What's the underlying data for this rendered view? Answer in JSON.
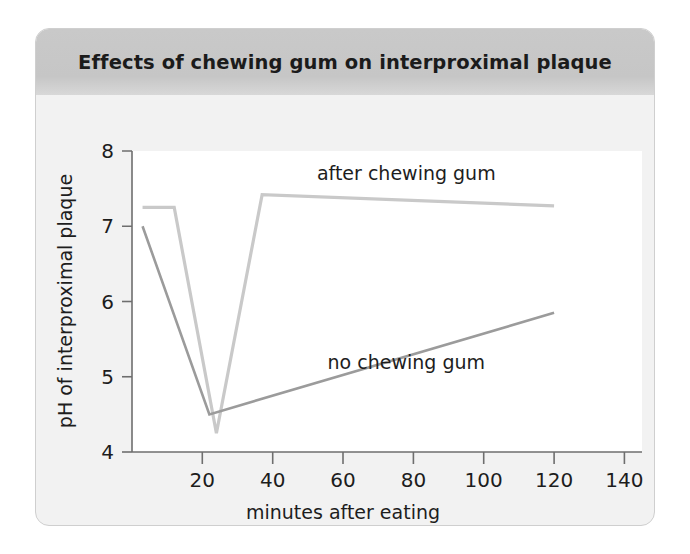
{
  "card": {
    "title": "Effects of chewing gum on interproximal plaque"
  },
  "chart_data": {
    "type": "line",
    "title": "Effects of chewing gum on interproximal plaque",
    "xlabel": "minutes after eating",
    "ylabel": "pH of interproximal plaque",
    "xlim": [
      0,
      145
    ],
    "ylim": [
      4,
      8
    ],
    "xticks": [
      20,
      40,
      60,
      80,
      100,
      120,
      140
    ],
    "yticks": [
      4,
      5,
      6,
      7,
      8
    ],
    "grid": false,
    "legend": "inline-annotations",
    "series": [
      {
        "name": "after chewing gum",
        "color": "#c9c9c9",
        "label_x": 78,
        "label_y": 7.62,
        "points": [
          {
            "x": 3,
            "y": 7.25
          },
          {
            "x": 12,
            "y": 7.25
          },
          {
            "x": 24,
            "y": 4.25
          },
          {
            "x": 37,
            "y": 7.42
          },
          {
            "x": 120,
            "y": 7.27
          }
        ]
      },
      {
        "name": "no chewing gum",
        "color": "#9b9b9b",
        "label_x": 78,
        "label_y": 5.1,
        "points": [
          {
            "x": 3,
            "y": 7.0
          },
          {
            "x": 22,
            "y": 4.5
          },
          {
            "x": 120,
            "y": 5.85
          }
        ]
      }
    ]
  },
  "axes": {
    "x_tick_labels": [
      "20",
      "40",
      "60",
      "80",
      "100",
      "120",
      "140"
    ],
    "y_tick_labels": [
      "4",
      "5",
      "6",
      "7",
      "8"
    ],
    "x_axis_title": "minutes after eating",
    "y_axis_title": "pH of interproximal plaque"
  },
  "series_labels": {
    "after": "after chewing gum",
    "no": "no chewing gum"
  }
}
